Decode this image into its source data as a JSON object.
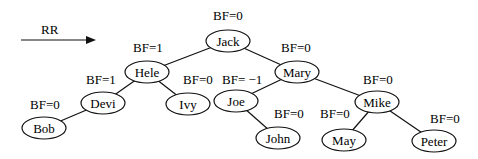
{
  "rotation_label": "RR",
  "nodes": [
    {
      "id": "jack",
      "name": "Jack",
      "bf": "BF=0",
      "cx": 228,
      "cy": 41,
      "rx": 22,
      "ry": 11,
      "bfx": 213,
      "bfy": 9
    },
    {
      "id": "hele",
      "name": "Hele",
      "bf": "BF=1",
      "cx": 147,
      "cy": 72,
      "rx": 22,
      "ry": 11,
      "bfx": 133,
      "bfy": 41
    },
    {
      "id": "mary",
      "name": "Mary",
      "bf": "BF=0",
      "cx": 297,
      "cy": 72,
      "rx": 22,
      "ry": 11,
      "bfx": 281,
      "bfy": 41
    },
    {
      "id": "devi",
      "name": "Devi",
      "bf": "BF=1",
      "cx": 103,
      "cy": 103,
      "rx": 22,
      "ry": 11,
      "bfx": 86,
      "bfy": 73
    },
    {
      "id": "ivy",
      "name": "Ivy",
      "bf": "BF=0",
      "cx": 188,
      "cy": 104,
      "rx": 22,
      "ry": 11,
      "bfx": 183,
      "bfy": 73
    },
    {
      "id": "joe",
      "name": "Joe",
      "bf": "BF= −1",
      "cx": 236,
      "cy": 101,
      "rx": 22,
      "ry": 11,
      "bfx": 222,
      "bfy": 73
    },
    {
      "id": "mike",
      "name": "Mike",
      "bf": "BF=0",
      "cx": 377,
      "cy": 102,
      "rx": 22,
      "ry": 11,
      "bfx": 363,
      "bfy": 73
    },
    {
      "id": "bob",
      "name": "Bob",
      "bf": "BF=0",
      "cx": 44,
      "cy": 128,
      "rx": 22,
      "ry": 11,
      "bfx": 30,
      "bfy": 98
    },
    {
      "id": "john",
      "name": "John",
      "bf": "BF=0",
      "cx": 278,
      "cy": 138,
      "rx": 22,
      "ry": 11,
      "bfx": 274,
      "bfy": 107
    },
    {
      "id": "may",
      "name": "May",
      "bf": "BF=0",
      "cx": 344,
      "cy": 140,
      "rx": 22,
      "ry": 11,
      "bfx": 320,
      "bfy": 107
    },
    {
      "id": "peter",
      "name": "Peter",
      "bf": "BF=0",
      "cx": 434,
      "cy": 141,
      "rx": 22,
      "ry": 11,
      "bfx": 430,
      "bfy": 112
    }
  ],
  "edges": [
    [
      "jack",
      "hele"
    ],
    [
      "jack",
      "mary"
    ],
    [
      "hele",
      "devi"
    ],
    [
      "hele",
      "ivy"
    ],
    [
      "devi",
      "bob"
    ],
    [
      "mary",
      "joe"
    ],
    [
      "mary",
      "mike"
    ],
    [
      "joe",
      "john"
    ],
    [
      "mike",
      "may"
    ],
    [
      "mike",
      "peter"
    ]
  ],
  "colors": {
    "stroke": "#111111",
    "text": "#000000",
    "background": "#ffffff"
  }
}
